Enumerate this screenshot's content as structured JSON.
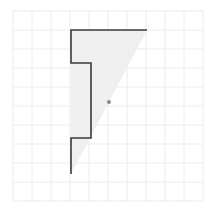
{
  "diagram": {
    "type": "grid-construction",
    "grid": {
      "x0": 13,
      "y0": 11,
      "cell": 19,
      "cols": 10,
      "rows": 10,
      "line_color": "#ececec"
    },
    "outline": {
      "color": "#3a3a3a",
      "points": [
        [
          147,
          30
        ],
        [
          71,
          30
        ],
        [
          71,
          63
        ],
        [
          91,
          63
        ],
        [
          91,
          138
        ],
        [
          71,
          138
        ],
        [
          71,
          174
        ]
      ]
    },
    "shaded_triangle": {
      "color": "#efefef",
      "points": [
        [
          71,
          30
        ],
        [
          147,
          30
        ],
        [
          71,
          174
        ]
      ]
    },
    "center_dot": {
      "x": 109,
      "y": 102,
      "r": 2,
      "color": "#888888"
    }
  }
}
